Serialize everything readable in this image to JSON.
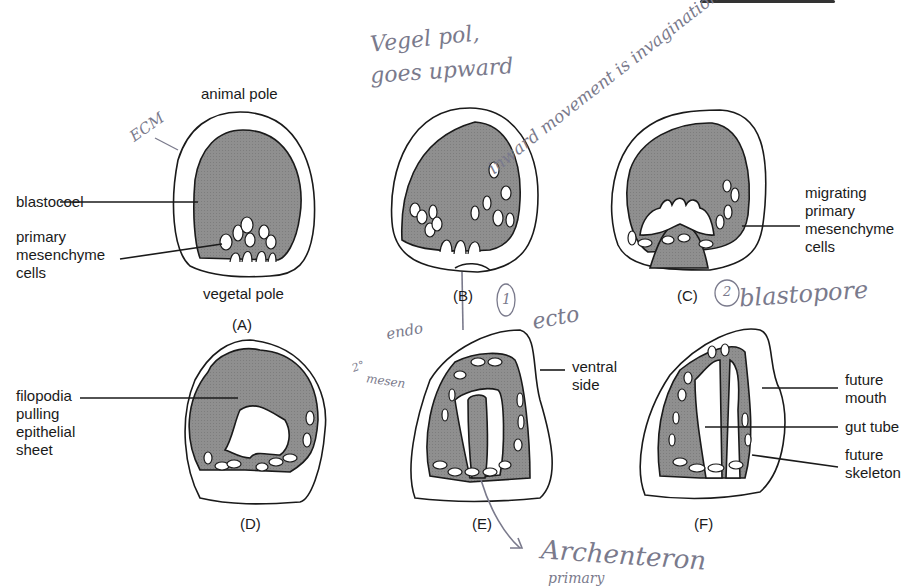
{
  "figure": {
    "panels": [
      {
        "id": "A",
        "letter": "(A)"
      },
      {
        "id": "B",
        "letter": "(B)"
      },
      {
        "id": "C",
        "letter": "(C)"
      },
      {
        "id": "D",
        "letter": "(D)"
      },
      {
        "id": "E",
        "letter": "(E)"
      },
      {
        "id": "F",
        "letter": "(F)"
      }
    ],
    "labels": {
      "animal_pole": "animal pole",
      "vegetal_pole": "vegetal pole",
      "blastocoel": "blastocoel",
      "primary_mesenchyme": "primary\nmesenchyme\ncells",
      "migrating_primary_mesenchyme": "migrating\nprimary\nmesenchyme\ncells",
      "filopodia": "filopodia\npulling\nepithelial\nsheet",
      "ventral_side": "ventral\nside",
      "future_mouth": "future\nmouth",
      "gut_tube": "gut tube",
      "future_skeleton": "future\nskeleton"
    },
    "handwritten": {
      "ecm": "ECM",
      "vegetal_note_1": "Vegel pol,",
      "vegetal_note_2": "goes upward",
      "inward_note": "inward movement is invagination",
      "circle_1": "1",
      "circle_2": "2",
      "blastopore": "blastopore",
      "ecto": "ecto",
      "endo": "endo",
      "secondary_mesen_1": "2°",
      "secondary_mesen_2": "mesen",
      "archenteron": "Archenteron",
      "archenteron_sub": "primary"
    },
    "colors": {
      "fill_gray": "#8f8f8f",
      "outline": "#1a1a1a",
      "handwriting": "#7a7a8c"
    }
  }
}
